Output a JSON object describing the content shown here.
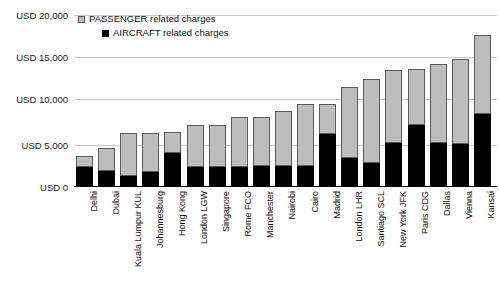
{
  "chart_data": {
    "type": "bar",
    "subtype": "stacked-vertical",
    "title": "",
    "xlabel": "",
    "ylabel": "",
    "ylim": [
      0,
      20000
    ],
    "grid": true,
    "legend_position": "top-left",
    "y_ticks": [
      {
        "value": 0,
        "label": "USD 0"
      },
      {
        "value": 5000,
        "label": "USD 5,000"
      },
      {
        "value": 10000,
        "label": "USD 10,000"
      },
      {
        "value": 15000,
        "label": "USD 15,000"
      },
      {
        "value": 20000,
        "label": "USD 20,000"
      }
    ],
    "categories": [
      "Delhi",
      "Dubai",
      "Kuala Lumpur KUL",
      "Johannesburg",
      "Hong Kong",
      "London LGW",
      "Singapore",
      "Rome FCO",
      "Manchester",
      "Nairobi",
      "Cairo",
      "Madrid",
      "London LHR",
      "Santiago SCL",
      "New York JFK",
      "Paris CDG",
      "Dallas",
      "Vienna",
      "Kansai"
    ],
    "series": [
      {
        "name": "AIRCRAFT related charges",
        "color": "#000000",
        "values": [
          2300,
          1900,
          1300,
          1700,
          3900,
          2300,
          2300,
          2300,
          2400,
          2400,
          2400,
          6200,
          3400,
          2800,
          5100,
          7200,
          5100,
          5000,
          8500
        ]
      },
      {
        "name": "PASSENGER related charges",
        "color": "#bdbdbd",
        "values": [
          1300,
          2600,
          5000,
          4600,
          2500,
          4900,
          4900,
          5900,
          5800,
          6400,
          7300,
          3500,
          8200,
          9800,
          8500,
          6500,
          9200,
          9900,
          9200
        ]
      }
    ],
    "totals": [
      3600,
      4500,
      6300,
      6300,
      6400,
      7200,
      7200,
      8200,
      8200,
      8800,
      9700,
      9700,
      11600,
      12600,
      13600,
      13700,
      14300,
      14900,
      17700
    ]
  },
  "legend": {
    "items": [
      {
        "label": "PASSENGER related charges",
        "swatch": "passenger"
      },
      {
        "label": "AIRCRAFT related charges",
        "swatch": "aircraft"
      }
    ]
  }
}
